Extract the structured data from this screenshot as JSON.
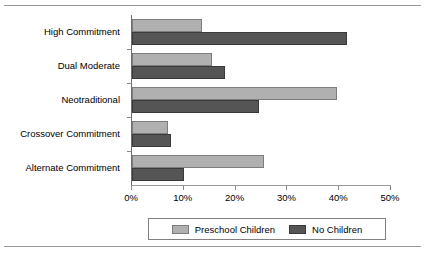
{
  "chart_data": {
    "type": "bar",
    "orientation": "horizontal",
    "title": "",
    "xlabel": "",
    "ylabel": "",
    "xlim": [
      0,
      50
    ],
    "xticks": [
      "0%",
      "10%",
      "20%",
      "30%",
      "40%",
      "50%"
    ],
    "xtick_values": [
      0,
      10,
      20,
      30,
      40,
      50
    ],
    "grid": false,
    "legend_position": "bottom",
    "categories": [
      "High Commitment",
      "Dual Moderate",
      "Neotraditional",
      "Crossover Commitment",
      "Alternate Commitment"
    ],
    "series": [
      {
        "name": "Preschool Children",
        "color": "#b0b0b0",
        "values": [
          13.5,
          15.5,
          39.5,
          7.0,
          25.5
        ]
      },
      {
        "name": "No Children",
        "color": "#555555",
        "values": [
          41.5,
          18.0,
          24.5,
          7.5,
          10.0
        ]
      }
    ]
  },
  "legend": {
    "items": [
      {
        "label": "Preschool Children",
        "swatch": "preschool"
      },
      {
        "label": "No Children",
        "swatch": "nochildren"
      }
    ]
  }
}
